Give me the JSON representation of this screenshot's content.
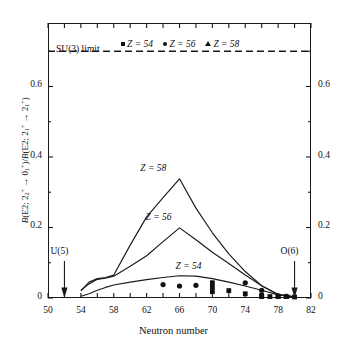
{
  "axes": {
    "x_title": "Neutron number",
    "y_title_parts": {
      "b1": "B",
      "open1": "(E2; 2",
      "sub2": "2",
      "sup1": "+",
      "arrow1": " → 0",
      "sub3": "1",
      "sup2": "+",
      "close1": ")/",
      "b2": "B",
      "open2": "(E2; 2",
      "sub4": "1",
      "sup3": "+",
      "arrow2": " → 2",
      "sub5": "1",
      "sup4": "+",
      "close2": ")"
    },
    "x_ticklabels": [
      "50",
      "54",
      "58",
      "62",
      "66",
      "70",
      "74",
      "78",
      "82"
    ],
    "y_ticklabels": [
      "0",
      "0.2",
      "0.4",
      "0.6"
    ],
    "y_ticklabels_right": [
      "0",
      "0.2",
      "0.4",
      "0.6"
    ]
  },
  "legend": {
    "entries": [
      {
        "marker": "square-marker",
        "label": "Z = 54"
      },
      {
        "marker": "circle-marker",
        "label": "Z = 56"
      },
      {
        "marker": "triangle-marker",
        "label": "Z = 58"
      }
    ]
  },
  "annotations": {
    "su3_limit": "SU(3) limit",
    "u5": "U(5)",
    "o6": "O(6)",
    "curve_z54": "Z = 54",
    "curve_z56": "Z = 56",
    "curve_z58": "Z = 58"
  },
  "colors": {
    "line": "#1a1a1a",
    "marker": "#111111",
    "frame": "#1a1a1a",
    "background": "#ffffff"
  },
  "chart_data": {
    "type": "line",
    "title": "",
    "xlabel": "Neutron number",
    "ylabel": "B(E2; 2_2+ -> 0_1+)/B(E2; 2_1+ -> 2_1+)",
    "xlim": [
      50,
      82
    ],
    "ylim": [
      0,
      0.78
    ],
    "xticks": [
      50,
      52,
      54,
      56,
      58,
      60,
      62,
      64,
      66,
      68,
      70,
      72,
      74,
      76,
      78,
      80,
      82
    ],
    "xtick_labeled": [
      50,
      54,
      58,
      62,
      66,
      70,
      74,
      78,
      82
    ],
    "yticks": [
      0,
      0.2,
      0.4,
      0.6
    ],
    "grid": false,
    "legend_position": "top-center",
    "reference_lines": [
      {
        "name": "SU(3) limit",
        "orientation": "horizontal",
        "y": 0.7,
        "style": "dashed"
      }
    ],
    "arrow_markers": [
      {
        "label": "U(5)",
        "x": 52,
        "y": 0.0
      },
      {
        "label": "O(6)",
        "x": 80,
        "y": 0.0
      }
    ],
    "series": [
      {
        "name": "Z = 54",
        "kind": "line",
        "x": [
          54,
          55,
          56,
          57,
          58,
          60,
          62,
          64,
          66,
          68,
          70,
          72,
          74,
          76,
          78,
          80
        ],
        "values": [
          0.005,
          0.012,
          0.022,
          0.03,
          0.037,
          0.045,
          0.052,
          0.058,
          0.063,
          0.062,
          0.055,
          0.045,
          0.034,
          0.022,
          0.009,
          0.003
        ]
      },
      {
        "name": "Z = 56",
        "kind": "line",
        "x": [
          54,
          55,
          56,
          57,
          58,
          60,
          62,
          64,
          66,
          68,
          70,
          72,
          74,
          76,
          78,
          80
        ],
        "values": [
          0.022,
          0.04,
          0.053,
          0.056,
          0.062,
          0.09,
          0.12,
          0.16,
          0.199,
          0.165,
          0.13,
          0.098,
          0.065,
          0.035,
          0.01,
          0.003
        ]
      },
      {
        "name": "Z = 58",
        "kind": "line",
        "x": [
          54,
          55,
          56,
          57,
          58,
          60,
          62,
          64,
          66,
          68,
          70,
          72,
          74,
          76,
          78,
          80
        ],
        "values": [
          0.02,
          0.045,
          0.055,
          0.058,
          0.065,
          0.15,
          0.23,
          0.285,
          0.338,
          0.255,
          0.185,
          0.125,
          0.075,
          0.035,
          0.01,
          0.003
        ]
      },
      {
        "name": "Z = 54 data",
        "kind": "scatter",
        "marker": "square",
        "points": [
          {
            "x": 70,
            "y": 0.043
          },
          {
            "x": 70,
            "y": 0.03
          },
          {
            "x": 70,
            "y": 0.018
          },
          {
            "x": 72,
            "y": 0.021
          },
          {
            "x": 74,
            "y": 0.012
          },
          {
            "x": 76,
            "y": 0.008
          },
          {
            "x": 76,
            "y": 0.004
          },
          {
            "x": 77,
            "y": 0.004
          },
          {
            "x": 78,
            "y": 0.004
          },
          {
            "x": 79,
            "y": 0.004
          },
          {
            "x": 80,
            "y": 0.003
          }
        ]
      },
      {
        "name": "Z = 56 data",
        "kind": "scatter",
        "marker": "circle",
        "points": [
          {
            "x": 64,
            "y": 0.038
          },
          {
            "x": 66,
            "y": 0.034
          },
          {
            "x": 68,
            "y": 0.036
          },
          {
            "x": 74,
            "y": 0.043
          },
          {
            "x": 76,
            "y": 0.022
          },
          {
            "x": 78,
            "y": 0.006
          },
          {
            "x": 79,
            "y": 0.005
          }
        ]
      },
      {
        "name": "Z = 58 data",
        "kind": "scatter",
        "marker": "triangle",
        "points": [
          {
            "x": 78,
            "y": 0.004
          },
          {
            "x": 79,
            "y": 0.004
          }
        ]
      }
    ]
  }
}
